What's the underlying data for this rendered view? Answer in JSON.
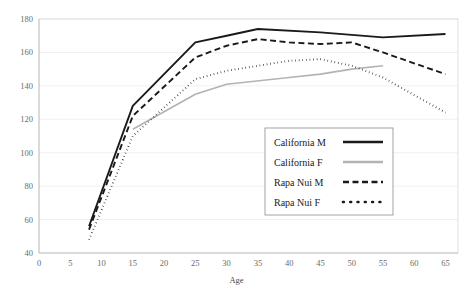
{
  "chart_data": {
    "type": "line",
    "title": "",
    "xlabel": "Age",
    "ylabel": "",
    "xlim": [
      0,
      67
    ],
    "ylim": [
      40,
      180
    ],
    "xticks": [
      0,
      5,
      10,
      15,
      20,
      25,
      30,
      35,
      40,
      45,
      50,
      55,
      60,
      65
    ],
    "yticks": [
      40,
      60,
      80,
      100,
      120,
      140,
      160,
      180
    ],
    "grid": "horizontal",
    "legend_position": "inside-right-lower",
    "series": [
      {
        "name": "California M",
        "style": "solid",
        "color": "#1a1a1a",
        "width": 1.9,
        "x": [
          8,
          15,
          25,
          30,
          35,
          45,
          55,
          65
        ],
        "y": [
          56,
          128,
          166,
          170,
          174,
          172,
          169,
          171
        ]
      },
      {
        "name": "California F",
        "style": "solid",
        "color": "#b3b3b3",
        "width": 1.6,
        "x": [
          15,
          25,
          30,
          40,
          45,
          50,
          55
        ],
        "y": [
          114,
          135,
          141,
          145,
          147,
          150,
          152
        ]
      },
      {
        "name": "Rapa Nui M",
        "style": "dashed",
        "color": "#1a1a1a",
        "width": 1.9,
        "x": [
          8,
          15,
          25,
          30,
          35,
          40,
          45,
          50,
          55,
          65
        ],
        "y": [
          54,
          122,
          157,
          164,
          168,
          166,
          165,
          166,
          160,
          147
        ]
      },
      {
        "name": "Rapa Nui F",
        "style": "dotted",
        "color": "#1a1a1a",
        "width": 1.9,
        "x": [
          8,
          15,
          25,
          30,
          35,
          40,
          45,
          50,
          55,
          65
        ],
        "y": [
          48,
          110,
          144,
          149,
          152,
          155,
          156,
          152,
          145,
          124
        ]
      }
    ]
  },
  "legend": {
    "entries": [
      {
        "label": "California M"
      },
      {
        "label": "California F"
      },
      {
        "label": "Rapa Nui M"
      },
      {
        "label": "Rapa Nui F"
      }
    ]
  },
  "axis": {
    "x_title": "Age"
  }
}
